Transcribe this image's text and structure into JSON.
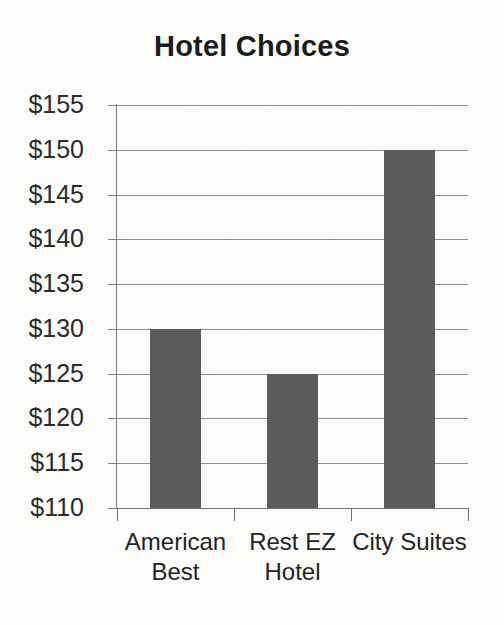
{
  "chart_data": {
    "type": "bar",
    "title": "Hotel Choices",
    "xlabel": "",
    "ylabel": "",
    "categories": [
      "American Best",
      "Rest EZ Hotel",
      "City Suites"
    ],
    "category_lines": [
      [
        "American",
        "Best"
      ],
      [
        "Rest EZ",
        "Hotel"
      ],
      [
        "City Suites"
      ]
    ],
    "values": [
      130,
      125,
      150
    ],
    "value_prefix": "$",
    "ylim": [
      110,
      155
    ],
    "ytick_step": 5,
    "ytick_labels": [
      "$155",
      "$150",
      "$145",
      "$140",
      "$135",
      "$130",
      "$125",
      "$120",
      "$115",
      "$110"
    ],
    "ytick_values": [
      155,
      150,
      145,
      140,
      135,
      130,
      125,
      120,
      115,
      110
    ],
    "grid": true,
    "legend": false,
    "bar_color": "#5b5b5b",
    "grid_color": "#8e8e8e",
    "axis_color": "#6f6f6f",
    "text_color": "#231f20",
    "background_color": "#fbfbfa"
  }
}
